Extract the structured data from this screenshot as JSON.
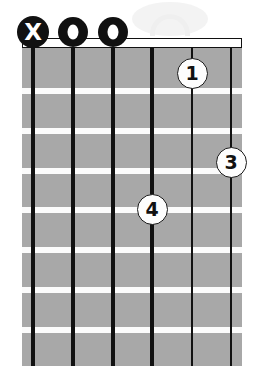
{
  "diagram": {
    "type": "guitar-chord-diagram",
    "orientation": "vertical",
    "string_count": 6,
    "fret_count": 8,
    "colors": {
      "fretboard": "#a8a8a8",
      "fret_line": "#fbfbfb",
      "string": "#111111",
      "nut_fill": "#ffffff",
      "nut_border": "#111111",
      "marker_fill": "#fdfdfd",
      "marker_text": "#111111",
      "mute_fill": "#111111",
      "background": "#ffffff"
    },
    "geometry": {
      "board_left": 22,
      "board_top": 48,
      "board_width": 220,
      "board_height": 318,
      "nut_top": 38,
      "nut_height": 10,
      "string_x": [
        33,
        73,
        113,
        152,
        192,
        231
      ],
      "string_width": [
        4,
        4,
        3.5,
        3.5,
        2.5,
        2
      ],
      "fret_y": [
        88,
        128,
        168,
        207,
        247,
        287,
        327
      ],
      "marker_row_y": 32
    },
    "nut": {
      "name": "nut",
      "visible": true
    },
    "open_mute_markers": [
      {
        "string": 1,
        "symbol": "X",
        "kind": "mute",
        "x": 33,
        "y": 32
      },
      {
        "string": 2,
        "symbol": "O",
        "kind": "open",
        "x": 73,
        "y": 32
      },
      {
        "string": 3,
        "symbol": "O",
        "kind": "open",
        "x": 113,
        "y": 32
      }
    ],
    "finger_markers": [
      {
        "label": "1",
        "string": 5,
        "fret": 1,
        "x": 192,
        "y": 73
      },
      {
        "label": "3",
        "string": 6,
        "fret": 3,
        "x": 231,
        "y": 162
      },
      {
        "label": "4",
        "string": 4,
        "fret": 4,
        "x": 152,
        "y": 209
      }
    ],
    "watermark": {
      "visible": true,
      "description": "faint light-gray circular watermark"
    }
  }
}
